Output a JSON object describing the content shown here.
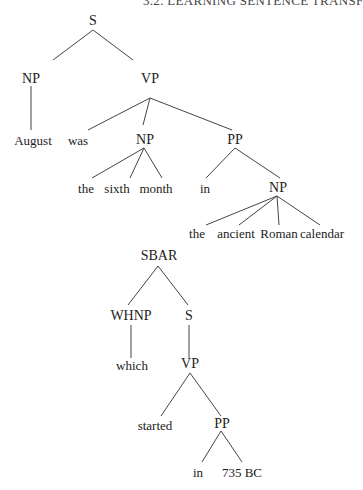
{
  "header": {
    "running_title": "3.2. LEARNING SENTENCE TRANSF"
  },
  "tree1": {
    "nodes": {
      "S": "S",
      "NP1": "NP",
      "VP": "VP",
      "August": "August",
      "was": "was",
      "NP2": "NP",
      "PP": "PP",
      "the1": "the",
      "sixth": "sixth",
      "month": "month",
      "in1": "in",
      "NP3": "NP",
      "the2": "the",
      "ancient": "ancient",
      "Roman": "Roman",
      "calendar": "calendar"
    }
  },
  "tree2": {
    "nodes": {
      "SBAR": "SBAR",
      "WHNP": "WHNP",
      "S": "S",
      "which": "which",
      "VP": "VP",
      "started": "started",
      "PP": "PP",
      "in": "in",
      "735BC": "735 BC"
    }
  }
}
